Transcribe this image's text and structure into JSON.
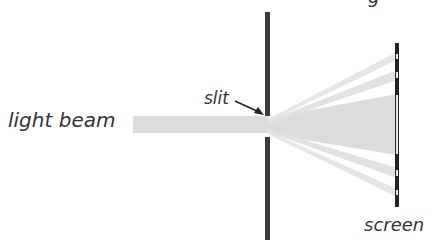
{
  "diagram": {
    "type": "single-slit diffraction",
    "labels": {
      "light_beam": "light beam",
      "slit": "slit",
      "screen": "screen",
      "cropped_top": "g"
    },
    "colors": {
      "beam": "#dcdcdc",
      "barrier": "#3a3a3a",
      "screen": "#222222",
      "screen_bright": "#e6e6e6",
      "text": "#333333"
    }
  }
}
